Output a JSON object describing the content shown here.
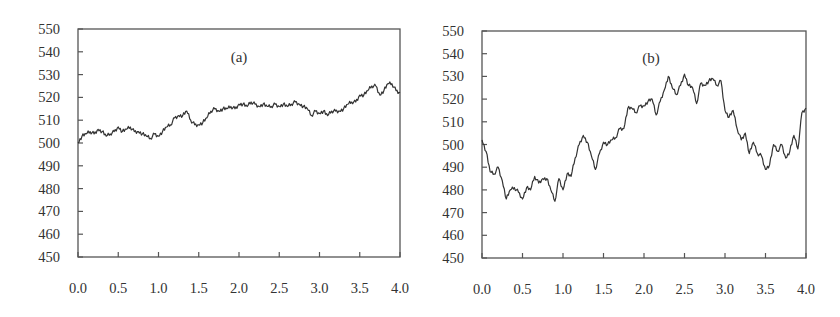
{
  "chart_data": [
    {
      "type": "line",
      "panel_label": "(a)",
      "title": "",
      "xlabel": "",
      "ylabel": "",
      "xlim": [
        0.0,
        4.0
      ],
      "ylim": [
        450,
        550
      ],
      "x_ticks": [
        "0.0",
        "0.5",
        "1.0",
        "1.5",
        "2.0",
        "2.5",
        "3.0",
        "3.5",
        "4.0"
      ],
      "y_ticks": [
        "550",
        "540",
        "530",
        "520",
        "510",
        "500",
        "490",
        "480",
        "470",
        "460",
        "450"
      ],
      "grid": false,
      "legend": null,
      "series": [
        {
          "name": "(a)",
          "x": [
            0.0,
            0.05,
            0.1,
            0.15,
            0.2,
            0.25,
            0.3,
            0.35,
            0.4,
            0.45,
            0.5,
            0.55,
            0.6,
            0.65,
            0.7,
            0.75,
            0.8,
            0.85,
            0.9,
            0.95,
            1.0,
            1.05,
            1.1,
            1.15,
            1.2,
            1.25,
            1.3,
            1.35,
            1.4,
            1.45,
            1.5,
            1.55,
            1.6,
            1.65,
            1.7,
            1.75,
            1.8,
            1.85,
            1.9,
            1.95,
            2.0,
            2.05,
            2.1,
            2.15,
            2.2,
            2.25,
            2.3,
            2.35,
            2.4,
            2.45,
            2.5,
            2.55,
            2.6,
            2.65,
            2.7,
            2.75,
            2.8,
            2.85,
            2.9,
            2.95,
            3.0,
            3.05,
            3.1,
            3.15,
            3.2,
            3.25,
            3.3,
            3.35,
            3.4,
            3.45,
            3.5,
            3.55,
            3.6,
            3.65,
            3.7,
            3.75,
            3.8,
            3.85,
            3.9,
            3.95,
            4.0
          ],
          "y": [
            500,
            503,
            504,
            505,
            504,
            506,
            505,
            503,
            504,
            505,
            507,
            505,
            506,
            507,
            505,
            505,
            504,
            503,
            502,
            504,
            503,
            505,
            507,
            508,
            511,
            512,
            512,
            514,
            510,
            508,
            508,
            509,
            511,
            514,
            515,
            514,
            515,
            515,
            516,
            515,
            517,
            517,
            516,
            518,
            517,
            516,
            517,
            516,
            516,
            517,
            516,
            517,
            516,
            517,
            518,
            517,
            516,
            515,
            512,
            514,
            513,
            514,
            512,
            514,
            514,
            514,
            515,
            517,
            518,
            518,
            521,
            521,
            523,
            525,
            525,
            521,
            523,
            526,
            526,
            523,
            522
          ]
        }
      ]
    },
    {
      "type": "line",
      "panel_label": "(b)",
      "title": "",
      "xlabel": "",
      "ylabel": "",
      "xlim": [
        0.0,
        4.0
      ],
      "ylim": [
        450,
        550
      ],
      "x_ticks": [
        "0.0",
        "0.5",
        "1.0",
        "1.5",
        "2.0",
        "2.5",
        "3.0",
        "3.5",
        "4.0"
      ],
      "y_ticks": [
        "550",
        "540",
        "530",
        "520",
        "510",
        "500",
        "490",
        "480",
        "470",
        "460",
        "450"
      ],
      "grid": false,
      "legend": null,
      "series": [
        {
          "name": "(b)",
          "x": [
            0.0,
            0.05,
            0.1,
            0.15,
            0.2,
            0.25,
            0.3,
            0.35,
            0.4,
            0.45,
            0.5,
            0.55,
            0.6,
            0.65,
            0.7,
            0.75,
            0.8,
            0.85,
            0.9,
            0.95,
            1.0,
            1.05,
            1.1,
            1.15,
            1.2,
            1.25,
            1.3,
            1.35,
            1.4,
            1.45,
            1.5,
            1.55,
            1.6,
            1.65,
            1.7,
            1.75,
            1.8,
            1.85,
            1.9,
            1.95,
            2.0,
            2.05,
            2.1,
            2.15,
            2.2,
            2.25,
            2.3,
            2.35,
            2.4,
            2.45,
            2.5,
            2.55,
            2.6,
            2.65,
            2.7,
            2.75,
            2.8,
            2.85,
            2.9,
            2.95,
            3.0,
            3.05,
            3.1,
            3.15,
            3.2,
            3.25,
            3.3,
            3.35,
            3.4,
            3.45,
            3.5,
            3.55,
            3.6,
            3.65,
            3.7,
            3.75,
            3.8,
            3.85,
            3.9,
            3.95,
            4.0
          ],
          "y": [
            502,
            497,
            488,
            487,
            490,
            484,
            476,
            480,
            481,
            479,
            476,
            481,
            480,
            486,
            483,
            485,
            485,
            480,
            475,
            485,
            480,
            487,
            486,
            494,
            500,
            504,
            501,
            495,
            489,
            496,
            501,
            500,
            502,
            503,
            507,
            507,
            516,
            516,
            514,
            517,
            517,
            519,
            520,
            513,
            519,
            524,
            530,
            525,
            522,
            526,
            531,
            526,
            525,
            518,
            527,
            526,
            528,
            529,
            526,
            528,
            515,
            512,
            515,
            507,
            502,
            505,
            496,
            501,
            496,
            495,
            489,
            491,
            500,
            497,
            500,
            494,
            497,
            504,
            498,
            514,
            516
          ]
        }
      ]
    }
  ]
}
